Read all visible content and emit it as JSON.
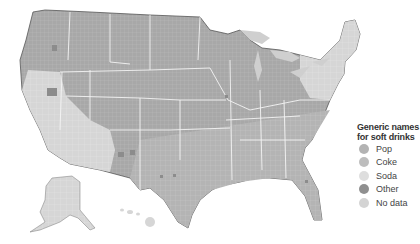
{
  "legend": {
    "title_line1": "Generic names",
    "title_line2": "for soft drinks",
    "items": [
      {
        "label": "Pop",
        "color": "#b3b3b3"
      },
      {
        "label": "Coke",
        "color": "#bdbdbd"
      },
      {
        "label": "Soda",
        "color": "#dedede"
      },
      {
        "label": "Other",
        "color": "#8f8f8f"
      },
      {
        "label": "No data",
        "color": "#d4d4d4"
      }
    ]
  },
  "map": {
    "subject": "US counties choropleth",
    "colors": {
      "pop": "#a9a9a9",
      "coke": "#b9b9b9",
      "soda": "#d9d9d9",
      "other": "#8c8c8c",
      "lakes": "#cfcfcf",
      "borders": "#f2f2f2",
      "coast": "#555555"
    }
  }
}
